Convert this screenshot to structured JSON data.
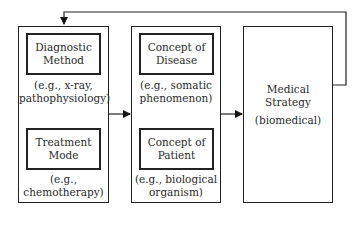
{
  "diagram": {
    "type": "flow",
    "groups": [
      {
        "id": "left",
        "nodes": [
          {
            "id": "diagnostic",
            "title": "Diagnostic Method",
            "title_lines": [
              "Diagnostic",
              "Method"
            ],
            "example_lines": [
              "(e.g., x-ray,",
              "pathophysiology)"
            ]
          },
          {
            "id": "treatment",
            "title": "Treatment Mode",
            "title_lines": [
              "Treatment",
              "Mode"
            ],
            "example_lines": [
              "(e.g.,",
              "chemotherapy)"
            ]
          }
        ]
      },
      {
        "id": "middle",
        "nodes": [
          {
            "id": "disease",
            "title": "Concept of Disease",
            "title_lines": [
              "Concept of",
              "Disease"
            ],
            "example_lines": [
              "(e.g., somatic",
              "phenomenon)"
            ]
          },
          {
            "id": "patient",
            "title": "Concept of Patient",
            "title_lines": [
              "Concept of",
              "Patient"
            ],
            "example_lines": [
              "(e.g., biological",
              "organism)"
            ]
          }
        ]
      },
      {
        "id": "right",
        "nodes": [
          {
            "id": "strategy",
            "title": "Medical Strategy",
            "title_lines": [
              "Medical",
              "Strategy"
            ],
            "example_lines": [
              "(biomedical)"
            ]
          }
        ]
      }
    ],
    "edges": [
      {
        "from": "diagnostic",
        "to": "treatment"
      },
      {
        "from": "disease",
        "to": "patient"
      },
      {
        "from": "patient",
        "to": "disease"
      },
      {
        "from": "left",
        "to": "middle"
      },
      {
        "from": "middle",
        "to": "right"
      },
      {
        "from": "right",
        "to": "left",
        "label": "feedback"
      }
    ]
  }
}
